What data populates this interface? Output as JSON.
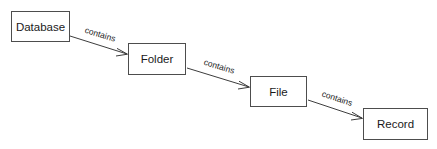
{
  "diagram": {
    "background_color": "#ffffff",
    "box_fill_color": "#ffffff",
    "box_border_color": "#4d4d4d",
    "line_color": "#3d3d3d",
    "text_color": "#1a1a1a",
    "entities": [
      {
        "id": "database",
        "label": "Database",
        "x": 11,
        "y": 11,
        "width": 59,
        "height": 31
      },
      {
        "id": "folder",
        "label": "Folder",
        "x": 128,
        "y": 43,
        "width": 58,
        "height": 32
      },
      {
        "id": "file",
        "label": "File",
        "x": 250,
        "y": 76,
        "width": 57,
        "height": 31
      },
      {
        "id": "record",
        "label": "Record",
        "x": 363,
        "y": 108,
        "width": 65,
        "height": 32
      }
    ],
    "relations": [
      {
        "id": "database-contains-folder",
        "label": "contains",
        "from": "database",
        "to": "folder",
        "x1": 70,
        "y1": 36,
        "x2": 127,
        "y2": 54,
        "label_x": 100,
        "label_y": 35,
        "label_rotation": 17
      },
      {
        "id": "folder-contains-file",
        "label": "contains",
        "from": "folder",
        "to": "file",
        "x1": 187,
        "y1": 68,
        "x2": 249,
        "y2": 87,
        "label_x": 219,
        "label_y": 67,
        "label_rotation": 17
      },
      {
        "id": "file-contains-record",
        "label": "contains",
        "from": "file",
        "to": "record",
        "x1": 308,
        "y1": 100,
        "x2": 362,
        "y2": 118,
        "label_x": 337,
        "label_y": 99,
        "label_rotation": 18
      }
    ]
  }
}
